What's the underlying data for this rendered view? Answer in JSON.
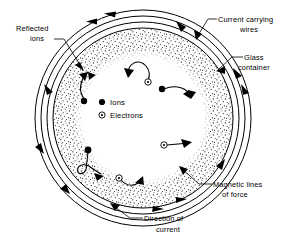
{
  "figure": {
    "background_color": "#ffffff",
    "ink_color": "#000000",
    "width": 285,
    "height": 242
  },
  "labels": {
    "reflected_ions": {
      "line1": "Reflected",
      "line2": "ions"
    },
    "current_carrying_wires": {
      "line1": "Current carrying",
      "line2": "wires"
    },
    "glass_container": {
      "line1": "Glass",
      "line2": "container"
    },
    "magnetic_lines_of_force": {
      "line1": "Magnetic lines",
      "line2": "of force"
    },
    "direction_of_current": {
      "line1": "Direction of",
      "line2": "current"
    }
  },
  "legend": {
    "items": [
      {
        "symbol": "filled-dot-icon",
        "label": "Ions"
      },
      {
        "symbol": "circled-dot-icon",
        "label": "Electrons"
      }
    ]
  },
  "vessel": {
    "center_x": 143,
    "center_y": 118,
    "rings": [
      {
        "name": "outer-wire-ring",
        "radius": 108
      },
      {
        "name": "middle-wire-ring",
        "radius": 102
      },
      {
        "name": "inner-wire-ring",
        "radius": 96
      },
      {
        "name": "glass-wall-ring",
        "radius": 90
      }
    ],
    "stipple_band": {
      "outer_radius": 90,
      "inner_radius": 68
    },
    "current_direction": "counterclockwise",
    "current_arrow_count": 8
  },
  "particles": [
    {
      "type": "ion",
      "region": "upper-left",
      "path": "reflected-from-wall"
    },
    {
      "type": "electron",
      "region": "upper-middle",
      "path": "curved-arc"
    },
    {
      "type": "ion",
      "region": "right",
      "path": "reflected-from-wall"
    },
    {
      "type": "electron",
      "region": "lower-right",
      "path": "straight-arrow"
    },
    {
      "type": "ion",
      "region": "lower-left",
      "path": "looped-cycloid"
    },
    {
      "type": "electron",
      "region": "lower-middle",
      "path": "curved-arc"
    }
  ]
}
